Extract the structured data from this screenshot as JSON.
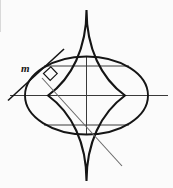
{
  "figure": {
    "background_color": "#fbfbfb",
    "stroke_color": "#151515",
    "thin_stroke_color": "#5a5a5a",
    "axis_color": "#3a3a3a",
    "width": 173,
    "height": 188,
    "labels": {
      "tangent_label": "m"
    },
    "elements": [
      {
        "name": "ellipse",
        "kind": "ellipse",
        "cx": 86.5,
        "cy": 95.5,
        "rx": 61.5,
        "ry": 39.0
      },
      {
        "name": "astroid",
        "kind": "evolute-curve",
        "cusp_top": [
          86.5,
          10
        ],
        "cusp_bottom": [
          86.5,
          181
        ],
        "cusp_left": [
          48,
          95.5
        ],
        "cusp_right": [
          125,
          95.5
        ]
      },
      {
        "name": "horizontal-axis",
        "kind": "line",
        "x1": 10,
        "y1": 95.5,
        "x2": 168,
        "y2": 95.5
      },
      {
        "name": "vertical-axis",
        "kind": "line",
        "x1": 86.5,
        "y1": 57,
        "x2": 86.5,
        "y2": 135
      },
      {
        "name": "tangent-line-m",
        "kind": "line",
        "x1": 8,
        "y1": 100,
        "x2": 64,
        "y2": 49
      },
      {
        "name": "normal-line",
        "kind": "line",
        "x1": 41.5,
        "y1": 79.5,
        "x2": 122,
        "y2": 166
      },
      {
        "name": "right-angle-marker",
        "kind": "square",
        "x": 45,
        "y": 66,
        "size": 9
      }
    ],
    "chord_top": {
      "x1": 48,
      "y1": 66,
      "x2": 125,
      "y2": 66
    },
    "chord_bottom": {
      "x1": 48,
      "y1": 125,
      "x2": 125,
      "y2": 125
    }
  }
}
